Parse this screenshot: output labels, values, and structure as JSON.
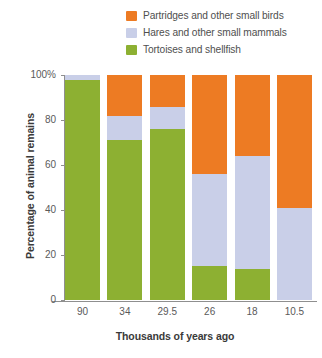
{
  "chart_data": {
    "type": "bar",
    "stacked": true,
    "title": "",
    "xlabel": "Thousands of years ago",
    "ylabel": "Percentage of animal remains",
    "categories": [
      "90",
      "34",
      "29.5",
      "26",
      "18",
      "10.5"
    ],
    "ylim": [
      0,
      100
    ],
    "ytick_labels": [
      "0",
      "20",
      "40",
      "60",
      "80",
      "100%"
    ],
    "ytick_values": [
      0,
      20,
      40,
      60,
      80,
      100
    ],
    "grid": false,
    "legend_position": "top-right",
    "series": [
      {
        "name": "Partridges and other small birds",
        "color": "#ED7B23",
        "values": [
          0,
          18,
          14,
          44,
          36,
          59
        ]
      },
      {
        "name": "Hares and other small mammals",
        "color": "#C9CFE8",
        "values": [
          2,
          11,
          10,
          41,
          50,
          41
        ]
      },
      {
        "name": "Tortoises and shellfish",
        "color": "#8DB032",
        "values": [
          98,
          71,
          76,
          15,
          14,
          0
        ]
      }
    ]
  },
  "legend": {
    "items": [
      {
        "label": "Partridges and other small birds",
        "color": "#ED7B23"
      },
      {
        "label": "Hares and other small mammals",
        "color": "#C9CFE8"
      },
      {
        "label": "Tortoises and shellfish",
        "color": "#8DB032"
      }
    ]
  }
}
